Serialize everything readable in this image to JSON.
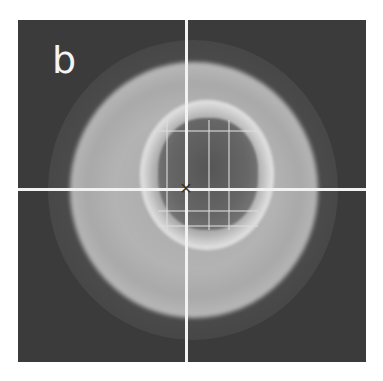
{
  "figure": {
    "panel_label": "b",
    "center_mark": "✕",
    "colors": {
      "background": "#3b3b3b",
      "outer_disk": "#b0b0b0",
      "inner_ring": "#f0f0f0",
      "inner_core": "#5a5a5a",
      "crosshair": "#f2f2f2"
    }
  }
}
